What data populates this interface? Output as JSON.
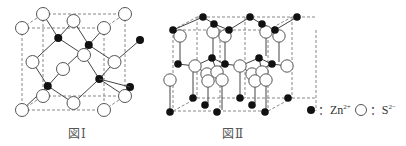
{
  "figures": [
    {
      "id": "fig1",
      "caption": "図Ⅰ",
      "structure": "zinc blende (cubic ZnS) unit cell"
    },
    {
      "id": "fig2",
      "caption": "図Ⅱ",
      "structure": "wurtzite (hexagonal ZnS) cell"
    }
  ],
  "legend": {
    "cation_label": "Zn",
    "cation_charge": "2+",
    "anion_label": "S",
    "anion_charge": "2−",
    "separator": "："
  },
  "colors": {
    "cation_fill": "#111111",
    "anion_fill": "#ffffff",
    "anion_stroke": "#555555",
    "bond": "#444444",
    "cell_edge": "#888888"
  }
}
